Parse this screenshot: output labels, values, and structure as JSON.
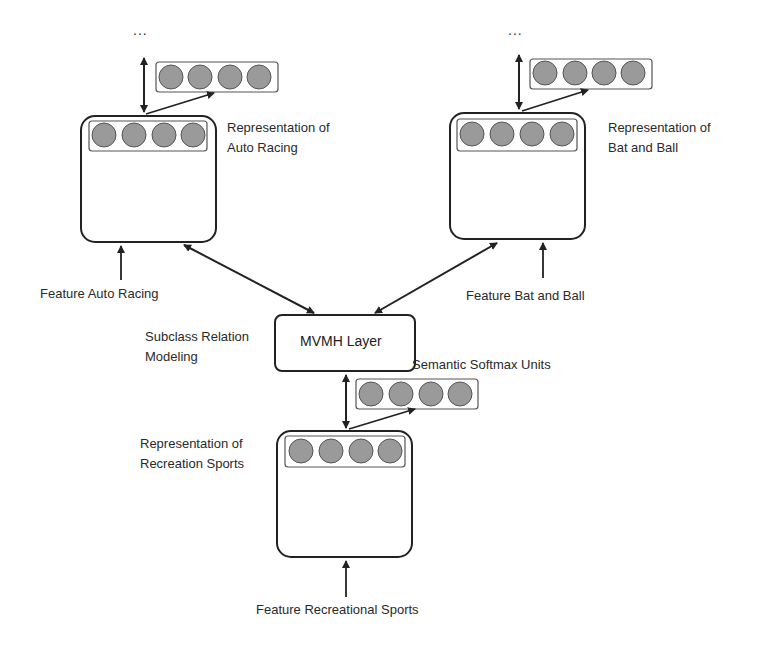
{
  "diagram": {
    "nodes": {
      "auto_racing": {
        "label_line1": "Representation of",
        "label_line2": "Auto Racing",
        "feature": "Feature Auto Racing",
        "ellipsis": "..."
      },
      "bat_and_ball": {
        "label_line1": "Representation of",
        "label_line2": "Bat and Ball",
        "feature": "Feature Bat and Ball",
        "ellipsis": "..."
      },
      "mvmh": {
        "label": "MVMH Layer",
        "side_label_line1": "Subclass Relation",
        "side_label_line2": "Modeling"
      },
      "recreation_sports": {
        "label_line1": "Representation of",
        "label_line2": "Recreation Sports",
        "feature": "Feature Recreational Sports",
        "softmax_label": "Semantic Softmax Units"
      }
    },
    "units_per_vector": 4,
    "colors": {
      "unit_fill": "#9a9a9a",
      "stroke": "#222222"
    }
  }
}
